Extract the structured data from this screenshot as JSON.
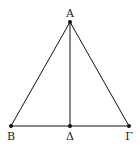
{
  "diagram": {
    "type": "geometry-triangle",
    "points": {
      "A": {
        "label": "Α",
        "x": 70,
        "y": 22
      },
      "B": {
        "label": "Β",
        "x": 11,
        "y": 126
      },
      "D": {
        "label": "Δ",
        "x": 70,
        "y": 126
      },
      "G": {
        "label": "Γ",
        "x": 129,
        "y": 126
      }
    },
    "segments": [
      [
        "A",
        "B"
      ],
      [
        "A",
        "G"
      ],
      [
        "B",
        "G"
      ],
      [
        "A",
        "D"
      ]
    ],
    "stroke_color": "#111111"
  }
}
